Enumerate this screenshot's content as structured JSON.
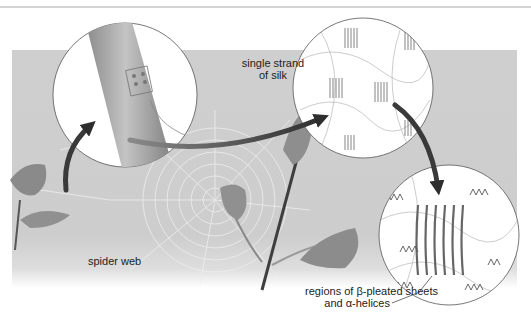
{
  "figure": {
    "labels": {
      "single_strand_line1": "single strand",
      "single_strand_line2": "of silk",
      "spider_web": "spider web",
      "regions_line1": "regions of β-pleated sheets",
      "regions_line2": "and α-helices"
    },
    "colors": {
      "background_band": "#cdcdcd",
      "arrow": "#3a3a3a",
      "circle_fill": "#ffffff",
      "strand": "#9a9a9a"
    },
    "panels": [
      {
        "name": "silk-strand-magnified",
        "cx": 125,
        "cy": 95,
        "r": 72
      },
      {
        "name": "protein-network-magnified",
        "cx": 363,
        "cy": 88,
        "r": 70
      },
      {
        "name": "beta-sheet-detail",
        "cx": 449,
        "cy": 235,
        "r": 70
      }
    ]
  }
}
